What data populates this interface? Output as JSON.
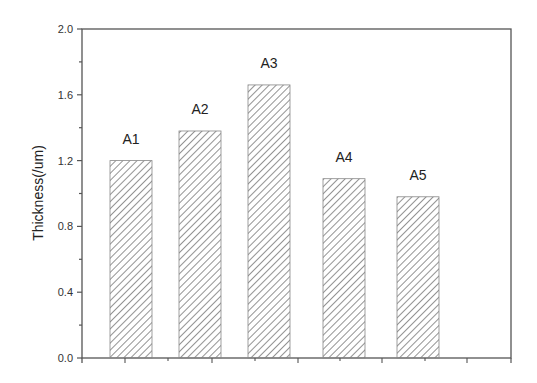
{
  "chart_data": {
    "type": "bar",
    "title": "",
    "xlabel": "",
    "ylabel": "Thickness(/um)",
    "categories": [
      "A1",
      "A2",
      "A3",
      "A4",
      "A5"
    ],
    "values": [
      1.2,
      1.38,
      1.66,
      1.09,
      0.98
    ],
    "bar_labels": [
      "A1",
      "A2",
      "A3",
      "A4",
      "A5"
    ],
    "ylim": [
      0.0,
      2.0
    ],
    "yticks": [
      "0.0",
      "0.4",
      "0.8",
      "1.2",
      "1.6",
      "2.0"
    ],
    "yticks_values": [
      0.0,
      0.4,
      0.8,
      1.2,
      1.6,
      2.0
    ],
    "grid": false,
    "legend": null,
    "bar_fill": "diagonal-hatch",
    "colors": {
      "axis": "#555555",
      "hatch": "#777777",
      "bar_edge": "#888888",
      "background": "#ffffff"
    }
  }
}
